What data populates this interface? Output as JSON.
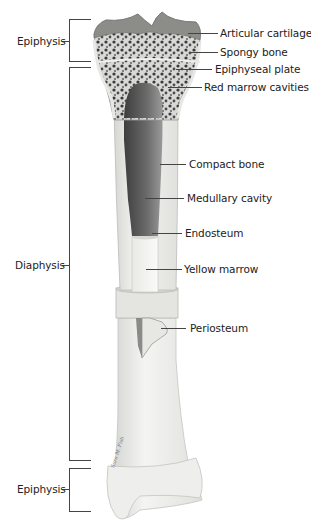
{
  "diagram": {
    "regions": [
      {
        "label": "Epiphysis",
        "position": "proximal"
      },
      {
        "label": "Diaphysis",
        "position": "shaft"
      },
      {
        "label": "Epiphysis",
        "position": "distal"
      }
    ],
    "parts": [
      {
        "label": "Articular cartilage"
      },
      {
        "label": "Spongy bone"
      },
      {
        "label": "Epiphyseal plate"
      },
      {
        "label": "Red marrow cavities"
      },
      {
        "label": "Compact bone"
      },
      {
        "label": "Medullary cavity"
      },
      {
        "label": "Endosteum"
      },
      {
        "label": "Yellow marrow"
      },
      {
        "label": "Periosteum"
      }
    ],
    "signature": "Sara M. Fish",
    "colors": {
      "background": "#ffffff",
      "bone": "#efefed",
      "bone_edge": "#b8b8b5",
      "cavity_dark": "#5a5a5a",
      "spongy": "#3a3a3a",
      "cartilage": "#8a8a8a",
      "text": "#222222",
      "line": "#444444"
    }
  }
}
